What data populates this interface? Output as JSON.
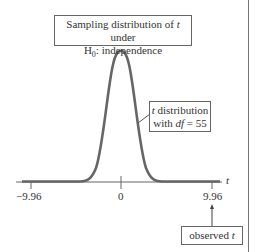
{
  "title_box": {
    "line1_prefix": "Sampling distribution of ",
    "line1_var": "t",
    "line1_suffix": " under",
    "line2_H": "H",
    "line2_sub": "0",
    "line2_suffix": ": independence"
  },
  "curve_label": {
    "line1_var": "t",
    "line1_suffix": " distribution",
    "line2_prefix": "with ",
    "line2_var": "df",
    "line2_suffix": " = 55"
  },
  "axis": {
    "var_label": "t",
    "ticks": [
      {
        "label": "−9.96",
        "value": -9.96
      },
      {
        "label": "0",
        "value": 0
      },
      {
        "label": "9.96",
        "value": 9.96
      }
    ]
  },
  "observed_box": {
    "prefix": "observed ",
    "var": "t"
  },
  "colors": {
    "curve": "#666666",
    "axis": "#666666",
    "text": "#333333"
  }
}
